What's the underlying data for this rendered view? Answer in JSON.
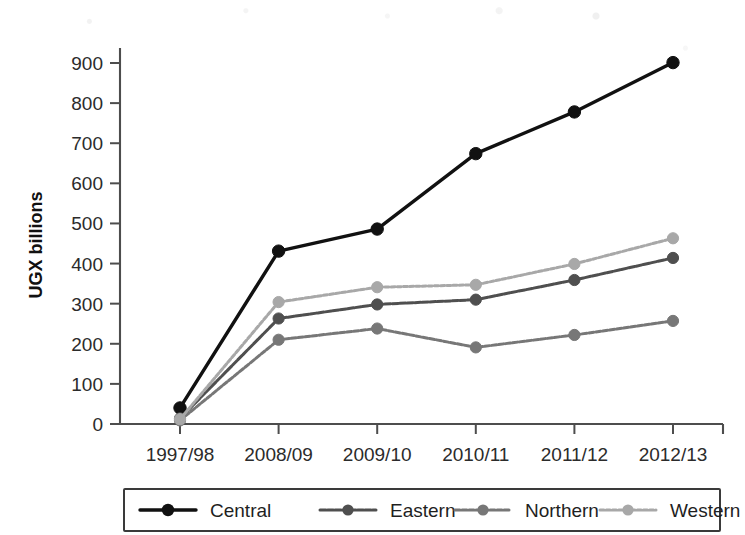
{
  "chart_data": {
    "type": "line",
    "title": "",
    "xlabel": "",
    "ylabel": "UGX billions",
    "categories": [
      "1997/98",
      "2008/09",
      "2009/10",
      "2010/11",
      "2011/12",
      "2012/13"
    ],
    "ylim": [
      0,
      900
    ],
    "yticks": [
      0,
      100,
      200,
      300,
      400,
      500,
      600,
      700,
      800,
      900
    ],
    "ytick_labels": [
      "0",
      "100",
      "200",
      "300",
      "400",
      "500",
      "600",
      "700",
      "800",
      "900"
    ],
    "grid": false,
    "legend_position": "bottom",
    "series": [
      {
        "name": "Central",
        "color": "#111111",
        "values": [
          40,
          431,
          486,
          674,
          778,
          901
        ]
      },
      {
        "name": "Eastern",
        "color": "#4f4f4f",
        "values": [
          14,
          263,
          298,
          310,
          359,
          414
        ]
      },
      {
        "name": "Northern",
        "color": "#777777",
        "values": [
          9,
          210,
          238,
          191,
          222,
          257
        ]
      },
      {
        "name": "Western",
        "color": "#a8a8a8",
        "values": [
          12,
          304,
          341,
          347,
          399,
          463
        ]
      }
    ]
  },
  "legend": {
    "entries": [
      {
        "label": "Central"
      },
      {
        "label": "Eastern"
      },
      {
        "label": "Northern"
      },
      {
        "label": "Western"
      }
    ]
  },
  "axis": {
    "y_title": "UGX billions"
  }
}
